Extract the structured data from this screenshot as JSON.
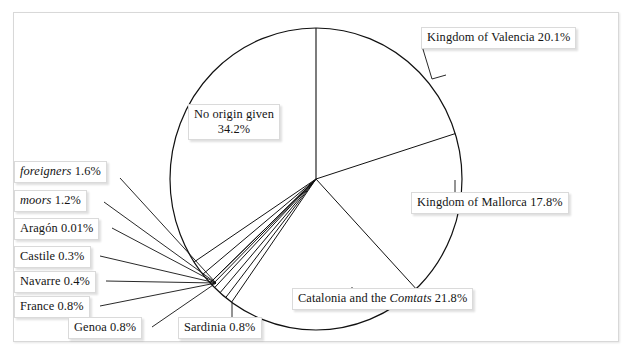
{
  "figure": {
    "background_color": "#ffffff",
    "frame_color": "#d8d8d8",
    "line_color": "#111111"
  },
  "chart_data": {
    "type": "pie",
    "title": "",
    "subtitle": "",
    "xlabel": "",
    "ylabel": "",
    "legend_position": "none",
    "grid": false,
    "units": "percent",
    "start_angle_deg": 0,
    "direction": "clockwise",
    "categories": [
      "Kingdom of Valencia",
      "Kingdom of Mallorca",
      "Catalonia and the Comtats",
      "Sardinia",
      "Genoa",
      "France",
      "Navarre",
      "Castile",
      "Aragón",
      "moors",
      "foreigners",
      "No origin given"
    ],
    "values": [
      20.1,
      17.8,
      21.8,
      0.8,
      0.8,
      0.8,
      0.4,
      0.3,
      0.01,
      1.2,
      1.6,
      34.2
    ],
    "slices": [
      {
        "name": "Kingdom of Valencia",
        "value": 20.1,
        "label": "Kingdom of Valencia 20.1%",
        "italic_part": ""
      },
      {
        "name": "Kingdom of Mallorca",
        "value": 17.8,
        "label": "Kingdom of Mallorca 17.8%",
        "italic_part": ""
      },
      {
        "name": "Catalonia and the Comtats",
        "value": 21.8,
        "label": "Catalonia and the Comtats 21.8%",
        "italic_part": "Comtats"
      },
      {
        "name": "Sardinia",
        "value": 0.8,
        "label": "Sardinia 0.8%",
        "italic_part": ""
      },
      {
        "name": "Genoa",
        "value": 0.8,
        "label": "Genoa 0.8%",
        "italic_part": ""
      },
      {
        "name": "France",
        "value": 0.8,
        "label": "France 0.8%",
        "italic_part": ""
      },
      {
        "name": "Navarre",
        "value": 0.4,
        "label": "Navarre 0.4%",
        "italic_part": ""
      },
      {
        "name": "Castile",
        "value": 0.3,
        "label": "Castile 0.3%",
        "italic_part": ""
      },
      {
        "name": "Aragón",
        "value": 0.01,
        "label": "Aragón 0.01%",
        "italic_part": ""
      },
      {
        "name": "moors",
        "value": 1.2,
        "label": "moors 1.2%",
        "italic_part": "moors"
      },
      {
        "name": "foreigners",
        "value": 1.6,
        "label": "foreigners 1.6%",
        "italic_part": "foreigners"
      },
      {
        "name": "No origin given",
        "value": 34.2,
        "label": "No origin given 34.2%",
        "italic_part": ""
      }
    ]
  },
  "labels": {
    "valencia": {
      "text": "Kingdom of Valencia 20.1%"
    },
    "mallorca": {
      "text": "Kingdom of Mallorca 17.8%"
    },
    "catalonia": {
      "pre": "Catalonia and the ",
      "ital": "Comtats",
      "post": " 21.8%"
    },
    "no_origin": {
      "line1": "No origin given",
      "line2": "34.2%"
    },
    "foreigners": {
      "ital": "foreigners",
      "post": " 1.6%"
    },
    "moors": {
      "ital": "moors",
      "post": " 1.2%"
    },
    "aragon": {
      "text": "Aragón 0.01%"
    },
    "castile": {
      "text": "Castile 0.3%"
    },
    "navarre": {
      "text": "Navarre 0.4%"
    },
    "france": {
      "text": "France 0.8%"
    },
    "genoa": {
      "text": "Genoa 0.8%"
    },
    "sardinia": {
      "text": "Sardinia 0.8%"
    }
  }
}
